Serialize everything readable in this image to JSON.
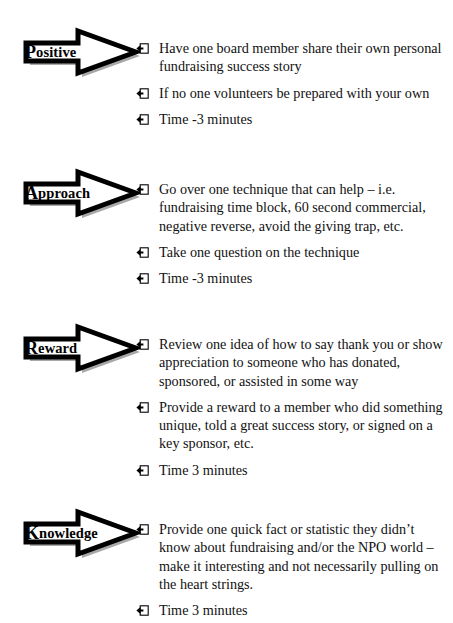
{
  "document": {
    "kind": "slide",
    "background_color": "#ffffff",
    "text_color": "#000000",
    "arrow_fill": "#ffffff",
    "arrow_stroke": "#000000",
    "shadow_color": "#a8a8a8"
  },
  "sections": [
    {
      "id": "positive",
      "arrow_label": "Positive",
      "arrow_label_cap": "P",
      "arrow_label_rest": "ositive",
      "bullets": [
        "Have one board member share their own personal fundraising success story",
        "If no one volunteers be prepared with your own",
        "Time -3 minutes"
      ]
    },
    {
      "id": "approach",
      "arrow_label": "Approach",
      "arrow_label_cap": "A",
      "arrow_label_rest": "pproach",
      "bullets": [
        "Go over one technique that can help – i.e. fundraising time block, 60 second commercial, negative reverse, avoid the giving trap, etc.",
        "Take one question on the technique",
        "Time -3 minutes"
      ]
    },
    {
      "id": "reward",
      "arrow_label": "Reward",
      "arrow_label_cap": "R",
      "arrow_label_rest": "eward",
      "bullets": [
        "Review one idea of how to say thank you or show appreciation to someone who has donated, sponsored, or assisted in some way",
        "Provide a reward to a member who did something unique, told a great success story, or signed on a key sponsor, etc.",
        "Time 3 minutes"
      ]
    },
    {
      "id": "knowledge",
      "arrow_label": "Knowledge",
      "arrow_label_cap": "K",
      "arrow_label_rest": "nowledge",
      "bullets": [
        "Provide one quick fact or statistic they didn’t know about fundraising and/or the NPO world – make it interesting and not necessarily pulling on the heart strings.",
        "Time 3 minutes"
      ]
    }
  ],
  "icons": {
    "bullet": "arrow-into-box-bullet-icon",
    "arrow": "block-arrow-right-icon"
  }
}
